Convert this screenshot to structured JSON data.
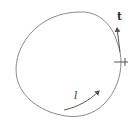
{
  "diagram": {
    "labels": {
      "tangent": "t",
      "path": "l"
    },
    "marks": {
      "cross": "+"
    },
    "colors": {
      "curve": "#8a8a8a",
      "arrows": "#555555",
      "text": "#333333",
      "background": "#ffffff"
    }
  }
}
